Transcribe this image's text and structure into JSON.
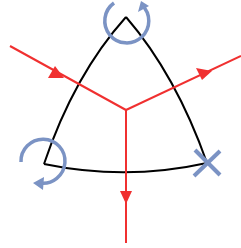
{
  "diagram": {
    "title": "",
    "colors": {
      "background": "#ffffff",
      "triangle": "#000000",
      "ray": "#f03030",
      "marker": "#7b93c4"
    },
    "triangle": {
      "description": "curved (Reuleaux-like) triangle outline",
      "vertices": {
        "top": [
          126,
          17
        ],
        "bottom_left": [
          44,
          164
        ],
        "bottom_right": [
          207,
          163
        ]
      }
    },
    "junction": [
      126,
      110
    ],
    "rays": [
      {
        "id": "incoming",
        "from": [
          10,
          46
        ],
        "to": [
          126,
          110
        ],
        "direction": "toward-junction"
      },
      {
        "id": "outgoing-right",
        "from": [
          126,
          110
        ],
        "to": [
          241,
          56
        ],
        "direction": "away-from-junction"
      },
      {
        "id": "outgoing-down",
        "from": [
          126,
          110
        ],
        "to": [
          126,
          243
        ],
        "direction": "away-from-junction"
      }
    ],
    "markers": [
      {
        "id": "top-vertex",
        "type": "rotation-arrow",
        "rotation": "clockwise",
        "center": [
          126,
          31
        ]
      },
      {
        "id": "bottom-left-vertex",
        "type": "rotation-arrow",
        "rotation": "clockwise",
        "center": [
          44,
          159
        ]
      },
      {
        "id": "bottom-right-vertex",
        "type": "cross",
        "center": [
          207,
          163
        ]
      }
    ]
  }
}
